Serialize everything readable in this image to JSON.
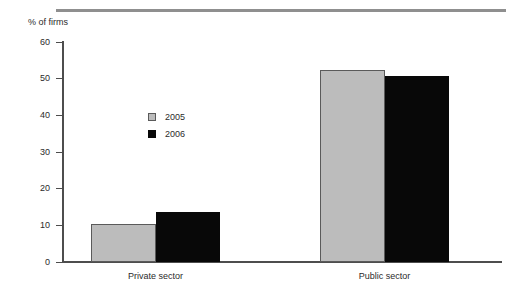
{
  "chart_data": {
    "type": "bar",
    "title": "",
    "subtitle": "",
    "ylabel": "% of firms",
    "xlabel": "",
    "categories": [
      "Private sector",
      "Public sector"
    ],
    "series": [
      {
        "name": "2005",
        "color": "#bcbcbc",
        "values": [
          10.4,
          52.3
        ]
      },
      {
        "name": "2006",
        "color": "#080808",
        "values": [
          13.6,
          50.8
        ]
      }
    ],
    "ylim": [
      0,
      60
    ],
    "ytick_values": [
      60,
      50,
      40,
      30,
      20,
      10,
      0
    ],
    "ytick_labels": [
      "60",
      "50",
      "40",
      "30",
      "20",
      "10",
      "0"
    ],
    "grid": false,
    "legend_position": "inside-left",
    "legend_entries": [
      "2005",
      "2006"
    ]
  },
  "decoration": {
    "top_rule_color": "#8f8f8f",
    "axis_color": "#4d4d4d",
    "text_color": "#2b2b2b"
  }
}
